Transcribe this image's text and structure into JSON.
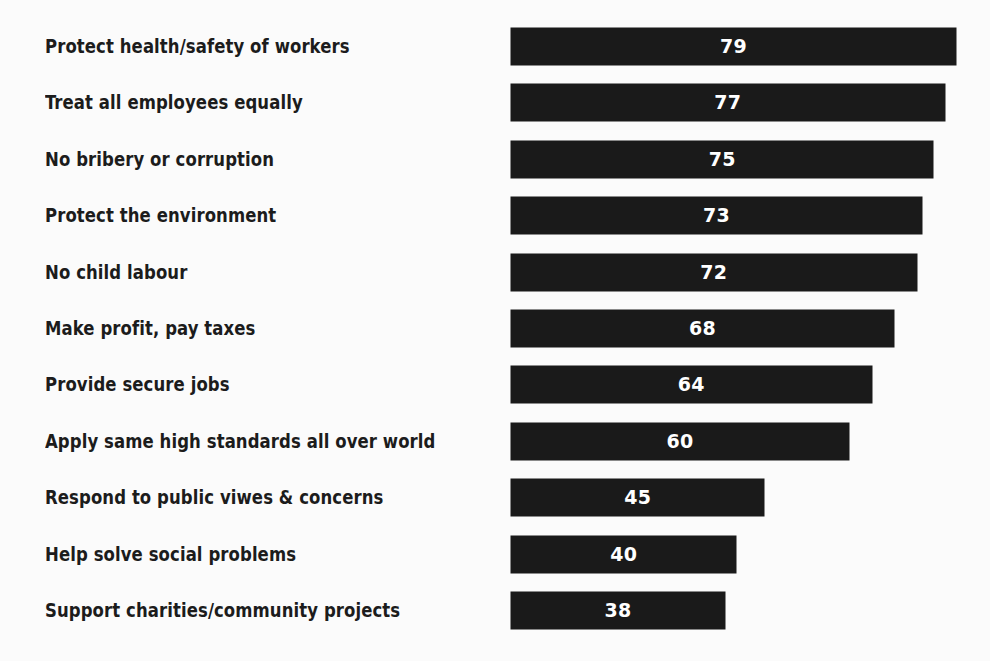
{
  "chart_data": {
    "type": "bar",
    "orientation": "horizontal",
    "title": "",
    "subtitle": "",
    "xlabel": "",
    "ylabel": "",
    "xlim": [
      0,
      79
    ],
    "grid": false,
    "legend": null,
    "value_label_position": "inside-center",
    "categories": [
      "Protect health/safety of workers",
      "Treat all employees equally",
      "No bribery or corruption",
      "Protect the environment",
      "No child labour",
      "Make profit, pay taxes",
      "Provide secure jobs",
      "Apply same high standards all over world",
      "Respond to public viwes & concerns",
      "Help solve social problems",
      "Support charities/community projects"
    ],
    "values": [
      79,
      77,
      75,
      73,
      72,
      68,
      64,
      60,
      45,
      40,
      38
    ],
    "value_labels": [
      "79",
      "77",
      "75",
      "73",
      "72",
      "68",
      "64",
      "60",
      "45",
      "40",
      "38"
    ],
    "series": [
      {
        "name": "",
        "values": [
          79,
          77,
          75,
          73,
          72,
          68,
          64,
          60,
          45,
          40,
          38
        ]
      }
    ]
  },
  "style": {
    "bar_color": "#1a1a1a",
    "background_color": "#fbfbfb",
    "label_color": "#1c1c1c",
    "value_label_color": "#ffffff"
  }
}
